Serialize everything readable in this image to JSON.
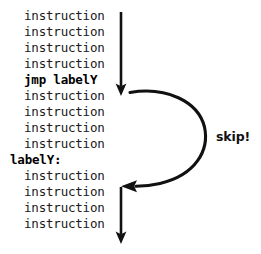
{
  "diagram": {
    "background_color": "#ffffff",
    "ink_color": "#111111"
  },
  "code_listing": {
    "lines": [
      {
        "text": "instruction",
        "style": "indent",
        "bold": false
      },
      {
        "text": "instruction",
        "style": "indent",
        "bold": false
      },
      {
        "text": "instruction",
        "style": "indent",
        "bold": false
      },
      {
        "text": "instruction",
        "style": "indent",
        "bold": false
      },
      {
        "text": "jmp labelY",
        "style": "indent",
        "bold": true
      },
      {
        "text": "instruction",
        "style": "indent",
        "bold": false
      },
      {
        "text": "instruction",
        "style": "indent",
        "bold": false
      },
      {
        "text": "instruction",
        "style": "indent",
        "bold": false
      },
      {
        "text": "instruction",
        "style": "indent",
        "bold": false
      },
      {
        "text": "labelY:",
        "style": "flush",
        "bold": true
      },
      {
        "text": "instruction",
        "style": "indent",
        "bold": false
      },
      {
        "text": "instruction",
        "style": "indent",
        "bold": false
      },
      {
        "text": "instruction",
        "style": "indent",
        "bold": false
      },
      {
        "text": "instruction",
        "style": "indent",
        "bold": false
      }
    ]
  },
  "annotations": {
    "skip_label": "skip!"
  },
  "arrows": {
    "top_flow_label": "downward-flow-arrow-top",
    "jump_curve_label": "jump-skip-curve-arrow",
    "bottom_flow_label": "downward-flow-arrow-bottom"
  }
}
